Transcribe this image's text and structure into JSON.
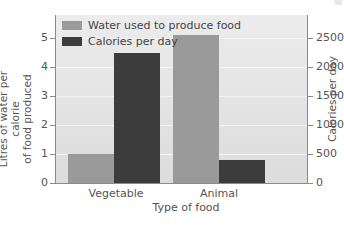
{
  "chart_data": {
    "type": "bar",
    "title": "",
    "xlabel": "Type of food",
    "ylabel": "Litres of water per calorie of food produced",
    "ylabel_right": "Calories per day",
    "categories": [
      "Vegetable",
      "Animal"
    ],
    "series": [
      {
        "name": "Water used to produce food",
        "axis": "left",
        "color": "#9a9a9a",
        "values": [
          1.0,
          5.1
        ]
      },
      {
        "name": "Calories per day",
        "axis": "right",
        "color": "#3c3c3c",
        "values": [
          2250,
          400
        ]
      }
    ],
    "ylim": [
      0,
      5.8
    ],
    "ylim_right": [
      0,
      2900
    ],
    "yticks": [
      "0",
      "1",
      "2",
      "3",
      "4",
      "5"
    ],
    "yticks_right": [
      "0",
      "500",
      "1000",
      "1500",
      "2000",
      "2500"
    ],
    "grid": true,
    "legend_position": "upper left"
  },
  "labels": {
    "ylabel_line1": "Litres of water per calorie",
    "ylabel_line2": "of food produced"
  }
}
